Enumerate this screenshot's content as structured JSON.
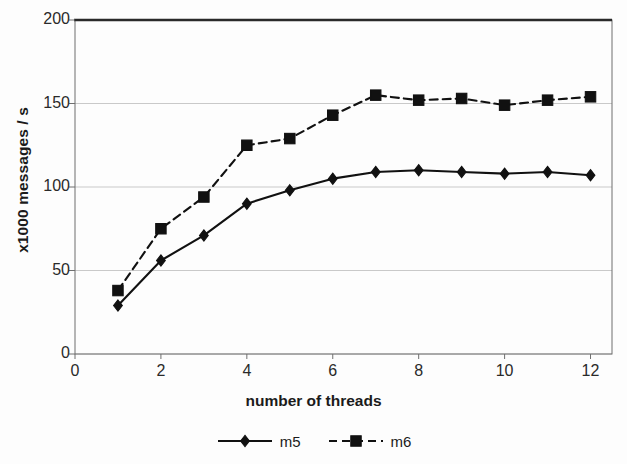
{
  "chart_data": {
    "type": "line",
    "title": "",
    "xlabel": "number of threads",
    "ylabel": "x1000 messages / s",
    "x": [
      1,
      2,
      3,
      4,
      5,
      6,
      7,
      8,
      9,
      10,
      11,
      12
    ],
    "xlim": [
      0,
      12.5
    ],
    "ylim": [
      0,
      200
    ],
    "xticks": [
      0,
      2,
      4,
      6,
      8,
      10,
      12
    ],
    "xtick_labels": [
      "0",
      "2",
      "4",
      "6",
      "8",
      "10",
      "12"
    ],
    "yticks": [
      0,
      50,
      100,
      150,
      200
    ],
    "ytick_labels": [
      "0",
      "50",
      "100",
      "150",
      "200"
    ],
    "grid": "horizontal",
    "legend_position": "bottom-center",
    "series": [
      {
        "name": "m5",
        "marker": "diamond",
        "linestyle": "solid",
        "color": "#111111",
        "values": [
          29,
          56,
          71,
          90,
          98,
          105,
          109,
          110,
          109,
          108,
          109,
          107
        ]
      },
      {
        "name": "m6",
        "marker": "square",
        "linestyle": "dashed",
        "color": "#111111",
        "values": [
          38,
          75,
          94,
          125,
          129,
          143,
          155,
          152,
          153,
          149,
          152,
          154
        ]
      }
    ]
  },
  "legend": {
    "items": [
      {
        "label": "m5"
      },
      {
        "label": "m6"
      }
    ]
  },
  "colors": {
    "ink": "#111111",
    "grid": "#c9c9c9",
    "frame": "#6f6f6f",
    "frame_top": "#2a2a2a",
    "background": "#fdfdfd"
  }
}
